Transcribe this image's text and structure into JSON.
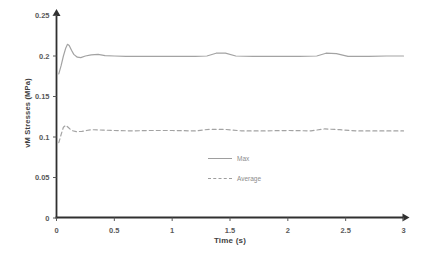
{
  "axes": {
    "x_title": "Time (s)",
    "y_title": "vM Stresses (MPa)"
  },
  "colors": {
    "background": "#ffffff",
    "axis_line": "#303030",
    "tick_text": "#595959",
    "axis_title_text": "#3f3f3f",
    "series_line": "#a3a3a3",
    "legend_text": "#8c8c8c"
  },
  "chart_data": {
    "type": "line",
    "title": "",
    "xlabel": "Time (s)",
    "ylabel": "vM Stresses (MPa)",
    "xlim": [
      0,
      3
    ],
    "ylim": [
      0,
      0.25
    ],
    "grid": false,
    "legend_position": "inside, center-bottom of plot area",
    "x_ticks": [
      0,
      0.5,
      1,
      1.5,
      2,
      2.5,
      3
    ],
    "x_tick_labels": [
      "0",
      "0.5",
      "1",
      "1.5",
      "2",
      "2.5",
      "3"
    ],
    "y_ticks": [
      0,
      0.05,
      0.1,
      0.15,
      0.2,
      0.25
    ],
    "y_tick_labels": [
      "0",
      "0.05",
      "0.1",
      "0.15",
      "0.2",
      "0.25"
    ],
    "series": [
      {
        "name": "Max",
        "style": "solid",
        "points": [
          [
            0.02,
            0.178
          ],
          [
            0.04,
            0.188
          ],
          [
            0.06,
            0.2
          ],
          [
            0.08,
            0.21
          ],
          [
            0.095,
            0.2145
          ],
          [
            0.11,
            0.213
          ],
          [
            0.13,
            0.207
          ],
          [
            0.15,
            0.202
          ],
          [
            0.18,
            0.1985
          ],
          [
            0.21,
            0.198
          ],
          [
            0.25,
            0.2
          ],
          [
            0.3,
            0.2015
          ],
          [
            0.36,
            0.202
          ],
          [
            0.42,
            0.2005
          ],
          [
            0.5,
            0.2
          ],
          [
            0.6,
            0.1995
          ],
          [
            0.8,
            0.1995
          ],
          [
            1.0,
            0.1995
          ],
          [
            1.2,
            0.1995
          ],
          [
            1.3,
            0.2
          ],
          [
            1.38,
            0.2035
          ],
          [
            1.46,
            0.2035
          ],
          [
            1.55,
            0.2
          ],
          [
            1.7,
            0.1995
          ],
          [
            1.9,
            0.1995
          ],
          [
            2.1,
            0.1995
          ],
          [
            2.25,
            0.2
          ],
          [
            2.33,
            0.2035
          ],
          [
            2.42,
            0.203
          ],
          [
            2.52,
            0.1995
          ],
          [
            2.7,
            0.1995
          ],
          [
            2.85,
            0.2
          ],
          [
            3.0,
            0.2
          ]
        ]
      },
      {
        "name": "Average",
        "style": "dashed",
        "points": [
          [
            0.02,
            0.093
          ],
          [
            0.04,
            0.103
          ],
          [
            0.06,
            0.112
          ],
          [
            0.08,
            0.1145
          ],
          [
            0.1,
            0.112
          ],
          [
            0.13,
            0.108
          ],
          [
            0.17,
            0.1065
          ],
          [
            0.22,
            0.107
          ],
          [
            0.3,
            0.109
          ],
          [
            0.4,
            0.1085
          ],
          [
            0.5,
            0.108
          ],
          [
            0.65,
            0.1075
          ],
          [
            0.8,
            0.108
          ],
          [
            1.0,
            0.108
          ],
          [
            1.2,
            0.1075
          ],
          [
            1.32,
            0.1095
          ],
          [
            1.45,
            0.1095
          ],
          [
            1.6,
            0.1075
          ],
          [
            1.8,
            0.1075
          ],
          [
            2.0,
            0.108
          ],
          [
            2.2,
            0.1075
          ],
          [
            2.32,
            0.11
          ],
          [
            2.45,
            0.109
          ],
          [
            2.6,
            0.1075
          ],
          [
            2.8,
            0.1075
          ],
          [
            3.0,
            0.1075
          ]
        ]
      }
    ]
  },
  "legend": {
    "max_label": "Max",
    "average_label": "Average"
  }
}
